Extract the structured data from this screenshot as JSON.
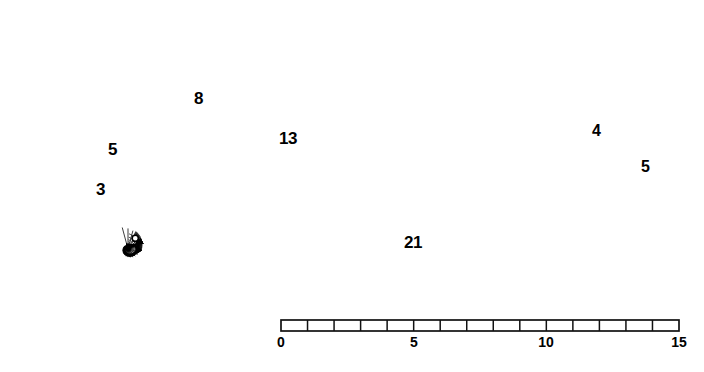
{
  "figure": {
    "background": "#ffffff",
    "ink": "#111111",
    "line_color_grid": "#1a1a1a",
    "line_color_spiral": "#000000",
    "width": 704,
    "height": 372
  },
  "spiral": {
    "name": "logarithmic-spiral",
    "center_x": 128,
    "center_y": 249,
    "growth_per_quarter_turn": 1.618,
    "start_radius": 1.4,
    "turns": 3.05,
    "stroke_width": 3.4
  },
  "polar_grid": {
    "radial_spokes": 24,
    "spiral_rings": 26,
    "description": "conformal grid of radial spokes crossed by logarithmic spiral arcs"
  },
  "fib_arrows": [
    {
      "id": "arrow-3",
      "label": "3",
      "label_x": 96,
      "label_y": 181,
      "angle_deg": 118,
      "length_units": 3
    },
    {
      "id": "arrow-5",
      "label": "5",
      "label_x": 108,
      "label_y": 141,
      "angle_deg": 96,
      "length_units": 5
    },
    {
      "id": "arrow-8",
      "label": "8",
      "label_x": 194,
      "label_y": 90,
      "angle_deg": 60,
      "length_units": 8
    },
    {
      "id": "arrow-13",
      "label": "13",
      "label_x": 279,
      "label_y": 130,
      "angle_deg": 30,
      "length_units": 13
    },
    {
      "id": "arrow-21",
      "label": "21",
      "label_x": 404,
      "label_y": 234,
      "angle_deg": 0,
      "length_units": 21
    }
  ],
  "square_labels": [
    {
      "id": "square-width-4",
      "text": "4",
      "x": 592,
      "y": 123
    },
    {
      "id": "square-height-5",
      "text": "5",
      "x": 641,
      "y": 159
    }
  ],
  "scale_bar": {
    "name": "linear-scale-bar",
    "x_start": 281,
    "x_end": 679,
    "y_top": 320,
    "y_bottom": 331,
    "divisions": 15,
    "min": 0,
    "max": 15,
    "ticks": [
      {
        "value": "0",
        "x": 281
      },
      {
        "value": "5",
        "x": 414
      },
      {
        "value": "10",
        "x": 546
      },
      {
        "value": "15",
        "x": 679
      }
    ],
    "tick_labels": [
      "0",
      "5",
      "10",
      "15"
    ]
  },
  "chart_data": {
    "type": "line",
    "xlabel": "",
    "ylabel": "",
    "categories": [
      "3",
      "5",
      "8",
      "13",
      "21"
    ],
    "values": [
      3,
      5,
      8,
      13,
      21
    ],
    "series": [
      {
        "name": "Fibonacci radius (units)",
        "values": [
          3,
          5,
          8,
          13,
          21
        ]
      }
    ],
    "annotations": [
      "3",
      "5",
      "8",
      "13",
      "21",
      "4",
      "5"
    ],
    "axis_scale": {
      "min": 0,
      "max": 15,
      "tick_step": 1,
      "major_labels": [
        0,
        5,
        10,
        15
      ]
    },
    "grid": true,
    "legend": "none"
  }
}
